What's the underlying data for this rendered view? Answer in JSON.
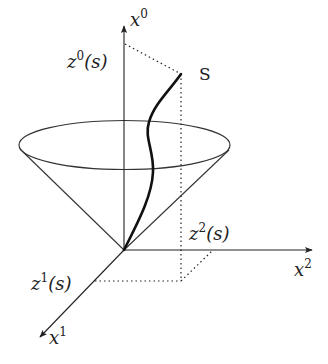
{
  "diagram": {
    "type": "light-cone worldline",
    "colors": {
      "stroke": "#222222",
      "background": "#ffffff"
    },
    "axes": {
      "x0": {
        "var": "x",
        "sup": "0"
      },
      "x1": {
        "var": "x",
        "sup": "1"
      },
      "x2": {
        "var": "x",
        "sup": "2"
      }
    },
    "projections": {
      "z0": {
        "var": "z",
        "sup": "0",
        "arg": "(s)"
      },
      "z1": {
        "var": "z",
        "sup": "1",
        "arg": "(s)"
      },
      "z2": {
        "var": "z",
        "sup": "2",
        "arg": "(s)"
      }
    },
    "curve_label": "S"
  }
}
